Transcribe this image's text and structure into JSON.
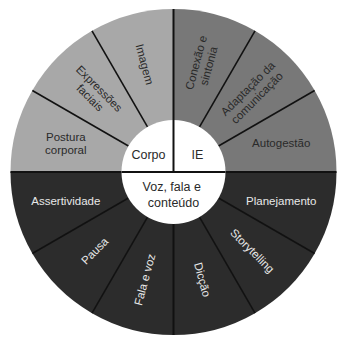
{
  "diagram": {
    "center": {
      "x": 173.5,
      "y": 172
    },
    "outer_radius": 163,
    "inner_radius": 52,
    "colors": {
      "corpo": "#a8a8a8",
      "ie": "#787878",
      "voz": "#2c2c2c",
      "inner": "#ffffff",
      "divider": "#111111",
      "label_dark": "#2a2a2a",
      "label_light": "#e8e8e8"
    },
    "groups": [
      {
        "id": "corpo",
        "label": "Corpo"
      },
      {
        "id": "ie",
        "label": "IE"
      },
      {
        "id": "voz",
        "label_lines": [
          "Voz, fala e",
          "conteúdo"
        ]
      }
    ],
    "segments": [
      {
        "group": "ie",
        "label_lines": [
          "Conexão e",
          "sintonia"
        ]
      },
      {
        "group": "ie",
        "label_lines": [
          "Adaptação da",
          "comunicação"
        ]
      },
      {
        "group": "ie",
        "label_lines": [
          "Autogestão"
        ]
      },
      {
        "group": "voz",
        "label_lines": [
          "Planejamento"
        ]
      },
      {
        "group": "voz",
        "label_lines": [
          "Storytelling"
        ]
      },
      {
        "group": "voz",
        "label_lines": [
          "Dicção"
        ]
      },
      {
        "group": "voz",
        "label_lines": [
          "Fala e voz"
        ]
      },
      {
        "group": "voz",
        "label_lines": [
          "Pausa"
        ]
      },
      {
        "group": "voz",
        "label_lines": [
          "Assertividade"
        ]
      },
      {
        "group": "corpo",
        "label_lines": [
          "Postura",
          "corporal"
        ]
      },
      {
        "group": "corpo",
        "label_lines": [
          "Expressões",
          "faciais"
        ]
      },
      {
        "group": "corpo",
        "label_lines": [
          "Imagem"
        ]
      }
    ]
  }
}
